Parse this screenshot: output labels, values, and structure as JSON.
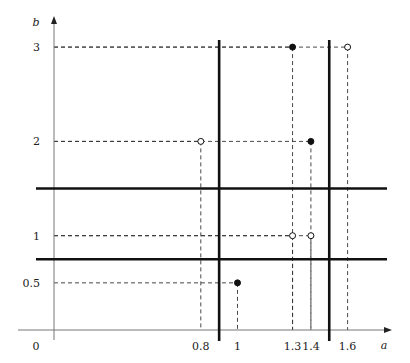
{
  "chart_data": {
    "type": "scatter",
    "title": "",
    "xlabel": "a",
    "ylabel": "b",
    "origin_label": "0",
    "x_ticks": [
      {
        "value": 0.8,
        "label": "0.8"
      },
      {
        "value": 1,
        "label": "1"
      },
      {
        "value": 1.3,
        "label": "1.3"
      },
      {
        "value": 1.4,
        "label": "1.4"
      },
      {
        "value": 1.6,
        "label": "1.6"
      }
    ],
    "y_ticks": [
      {
        "value": 0.5,
        "label": "0.5"
      },
      {
        "value": 1,
        "label": "1"
      },
      {
        "value": 2,
        "label": "2"
      },
      {
        "value": 3,
        "label": "3"
      }
    ],
    "points": [
      {
        "a": 1.3,
        "b": 3,
        "filled": true
      },
      {
        "a": 1.6,
        "b": 3,
        "filled": false
      },
      {
        "a": 0.8,
        "b": 2,
        "filled": false
      },
      {
        "a": 1.4,
        "b": 2,
        "filled": true
      },
      {
        "a": 1.3,
        "b": 1,
        "filled": false
      },
      {
        "a": 1.4,
        "b": 1,
        "filled": false
      },
      {
        "a": 1,
        "b": 0.5,
        "filled": true
      }
    ],
    "thick_vertical_lines_a": [
      0.9,
      1.5
    ],
    "thick_horizontal_lines_b": [
      1.5,
      0.75
    ],
    "grid": false,
    "legend": null
  },
  "colors": {
    "ink": "#111111",
    "axis": "#777777",
    "dashed": "#333333",
    "background": "#ffffff"
  }
}
